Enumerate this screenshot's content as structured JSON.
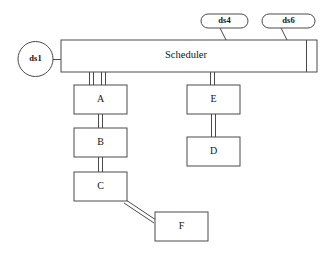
{
  "diagram": {
    "title": "Scheduler",
    "background_color": "#ffffff",
    "stroke_color": "#4a4a4a",
    "text_color": "#151515",
    "scheduler": {
      "label": "Scheduler",
      "shape": "bar-with-end-compartment"
    },
    "datastores": [
      {
        "id": "ds1",
        "label": "ds1",
        "shape": "circle"
      },
      {
        "id": "ds4",
        "label": "ds4",
        "shape": "stadium"
      },
      {
        "id": "ds6",
        "label": "ds6",
        "shape": "stadium"
      }
    ],
    "boxes": [
      {
        "id": "A",
        "label": "A"
      },
      {
        "id": "B",
        "label": "B"
      },
      {
        "id": "C",
        "label": "C"
      },
      {
        "id": "D",
        "label": "D"
      },
      {
        "id": "E",
        "label": "E"
      },
      {
        "id": "F",
        "label": "F"
      }
    ],
    "connections": [
      {
        "from": "ds1",
        "to": "Scheduler",
        "style": "single-line"
      },
      {
        "from": "ds4",
        "to": "Scheduler",
        "style": "single-line-diagonal"
      },
      {
        "from": "ds6",
        "to": "Scheduler",
        "style": "single-line-diagonal"
      },
      {
        "from": "Scheduler",
        "to": "A",
        "style": "double-line"
      },
      {
        "from": "Scheduler",
        "to": "A",
        "style": "double-line"
      },
      {
        "from": "Scheduler",
        "to": "E",
        "style": "double-line"
      },
      {
        "from": "A",
        "to": "B",
        "style": "double-line"
      },
      {
        "from": "B",
        "to": "C",
        "style": "double-line"
      },
      {
        "from": "C",
        "to": "F",
        "style": "double-line-diagonal"
      },
      {
        "from": "E",
        "to": "D",
        "style": "double-line"
      }
    ]
  }
}
